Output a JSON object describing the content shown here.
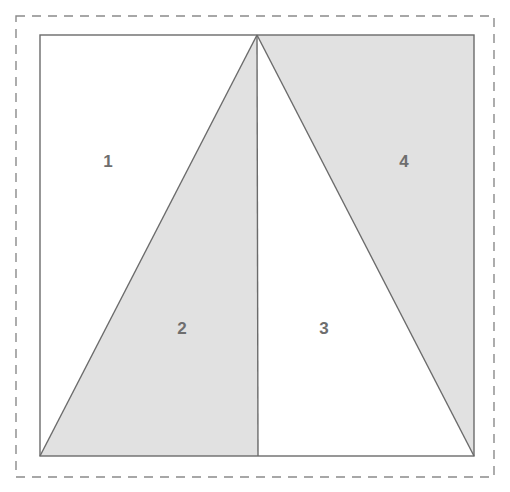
{
  "figure": {
    "background_color": "#ffffff",
    "canvas": {
      "width": 510,
      "height": 492
    },
    "bounding_box": {
      "name": "dashed-bounding-box",
      "style": "dashed",
      "stroke_color": "#8a8a8a",
      "stroke_width": 1.4,
      "dash_pattern": "9 7",
      "x": 16,
      "y": 16,
      "width": 478,
      "height": 461
    },
    "square": {
      "name": "outer-square",
      "stroke_color": "#6b6b6b",
      "stroke_width": 1.4,
      "fill_color": "#ffffff",
      "x": 40,
      "y": 35,
      "width": 434,
      "height": 421
    },
    "apex": {
      "x": 257,
      "y": 35
    },
    "base_left": {
      "x": 40,
      "y": 456
    },
    "base_right": {
      "x": 474,
      "y": 456
    },
    "median_foot": {
      "x": 258,
      "y": 456
    },
    "shaded_fill": "#e1e1e1",
    "unshaded_fill": "#ffffff",
    "line_color": "#6b6b6b",
    "label_color": "#6e6e6e",
    "regions": [
      {
        "id": "region-1",
        "label": "1",
        "shaded": false,
        "fill": "#ffffff",
        "label_x": 108,
        "label_y": 163,
        "points": "40,35 257,35 40,456"
      },
      {
        "id": "region-2",
        "label": "2",
        "shaded": true,
        "fill": "#e1e1e1",
        "label_x": 182,
        "label_y": 330,
        "points": "257,35 258,456 40,456"
      },
      {
        "id": "region-3",
        "label": "3",
        "shaded": false,
        "fill": "#ffffff",
        "label_x": 324,
        "label_y": 330,
        "points": "257,35 474,456 258,456"
      },
      {
        "id": "region-4",
        "label": "4",
        "shaded": true,
        "fill": "#e1e1e1",
        "label_x": 404,
        "label_y": 163,
        "points": "257,35 474,35 474,456"
      }
    ],
    "edges": [
      {
        "id": "edge-left-diagonal",
        "x1": 257,
        "y1": 35,
        "x2": 40,
        "y2": 456
      },
      {
        "id": "edge-median",
        "x1": 257,
        "y1": 35,
        "x2": 258,
        "y2": 456
      },
      {
        "id": "edge-right-diagonal",
        "x1": 257,
        "y1": 35,
        "x2": 474,
        "y2": 456
      }
    ]
  }
}
